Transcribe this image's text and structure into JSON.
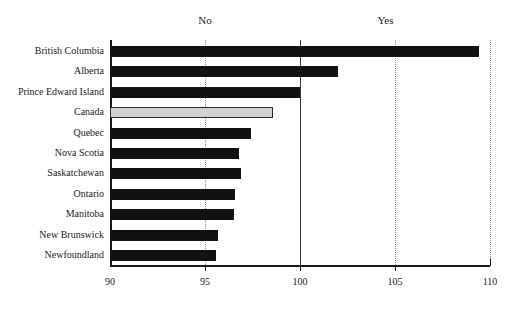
{
  "chart_data": {
    "type": "bar",
    "orientation": "horizontal",
    "title": "",
    "subtitle": "",
    "xlabel": "",
    "ylabel": "",
    "xlim": [
      90,
      110
    ],
    "xticks": [
      90,
      95,
      100,
      105,
      110
    ],
    "xtick_labels": [
      "90",
      "95",
      "100",
      "105",
      "110"
    ],
    "grid": true,
    "gridlines": [
      95,
      100,
      105,
      110
    ],
    "reference_line": 100,
    "legend_position": "none",
    "annotations": [
      {
        "text": "No",
        "x": 95,
        "position": "above-axis"
      },
      {
        "text": "Yes",
        "x": 104.5,
        "position": "above-axis"
      }
    ],
    "categories": [
      "British Columbia",
      "Alberta",
      "Prince Edward Island",
      "Canada",
      "Quebec",
      "Nova Scotia",
      "Saskatchewan",
      "Ontario",
      "Manitoba",
      "New Brunswick",
      "Newfoundland"
    ],
    "values": [
      109.4,
      102.0,
      100.0,
      98.6,
      97.4,
      96.8,
      96.9,
      96.6,
      96.5,
      95.7,
      95.6
    ],
    "highlight_category": "Canada",
    "colors": {
      "bar": "#111111",
      "highlight_bar": "#d2d2d2",
      "highlight_border": "#2a2a2a",
      "axis": "#1a1a1a",
      "gridline": "#8a8a8a",
      "reference_line": "#3a3a3a",
      "text": "#1a1a1a",
      "background": "#ffffff"
    }
  }
}
